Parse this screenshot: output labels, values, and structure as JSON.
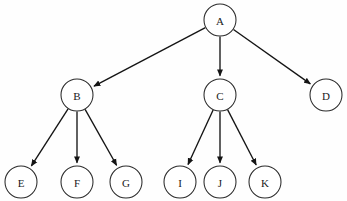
{
  "diagram": {
    "type": "directed-tree",
    "canvas": {
      "width": 347,
      "height": 201,
      "background": "#fefefe"
    },
    "style": {
      "node_fill": "#ffffff",
      "node_stroke": "#2b2b2b",
      "edge_stroke": "#141414",
      "label_color": "#1a1a1a",
      "node_radius": 16,
      "arrowhead": "filled-triangle"
    },
    "nodes": [
      {
        "id": "A",
        "label": "A",
        "cx": 220,
        "cy": 20,
        "r": 16,
        "level": 0
      },
      {
        "id": "B",
        "label": "B",
        "cx": 77,
        "cy": 95,
        "r": 16,
        "level": 1
      },
      {
        "id": "C",
        "label": "C",
        "cx": 220,
        "cy": 95,
        "r": 16,
        "level": 1
      },
      {
        "id": "D",
        "label": "D",
        "cx": 326,
        "cy": 95,
        "r": 16,
        "level": 1
      },
      {
        "id": "E",
        "label": "E",
        "cx": 21,
        "cy": 182,
        "r": 16,
        "level": 2
      },
      {
        "id": "F",
        "label": "F",
        "cx": 77,
        "cy": 182,
        "r": 16,
        "level": 2
      },
      {
        "id": "G",
        "label": "G",
        "cx": 126,
        "cy": 182,
        "r": 16,
        "level": 2
      },
      {
        "id": "I",
        "label": "I",
        "cx": 180,
        "cy": 182,
        "r": 16,
        "level": 2
      },
      {
        "id": "J",
        "label": "J",
        "cx": 220,
        "cy": 182,
        "r": 16,
        "level": 2
      },
      {
        "id": "K",
        "label": "K",
        "cx": 265,
        "cy": 182,
        "r": 16,
        "level": 2
      }
    ],
    "edges": [
      {
        "from": "A",
        "to": "B",
        "directed": true
      },
      {
        "from": "A",
        "to": "C",
        "directed": true
      },
      {
        "from": "A",
        "to": "D",
        "directed": true
      },
      {
        "from": "B",
        "to": "E",
        "directed": true
      },
      {
        "from": "B",
        "to": "F",
        "directed": true
      },
      {
        "from": "B",
        "to": "G",
        "directed": true
      },
      {
        "from": "C",
        "to": "I",
        "directed": true
      },
      {
        "from": "C",
        "to": "J",
        "directed": true
      },
      {
        "from": "C",
        "to": "K",
        "directed": true
      }
    ]
  }
}
